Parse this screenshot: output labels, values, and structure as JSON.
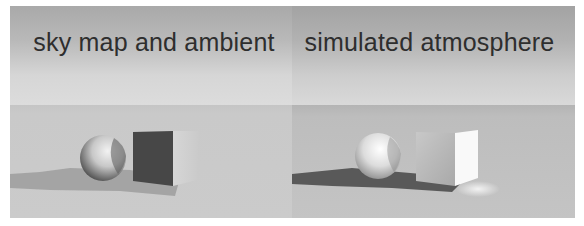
{
  "figure": {
    "panels": [
      {
        "id": "left",
        "caption": "sky map and ambient",
        "colors": {
          "sky_top": "#a9a9a9",
          "sky_bottom": "#dcdcdc",
          "ground": "#c9c9c9",
          "cube_front": "#4a4a4a",
          "cube_side": "#d2d2d2",
          "shadow": "#9e9e9e"
        }
      },
      {
        "id": "right",
        "caption": "simulated atmosphere",
        "colors": {
          "sky_top": "#a3a3a3",
          "sky_bottom": "#d9d9d9",
          "ground": "#bdbdbd",
          "cube_front": "#bcbcbc",
          "cube_side": "#f8f8f8",
          "shadow": "#5a5a5a"
        }
      }
    ]
  }
}
